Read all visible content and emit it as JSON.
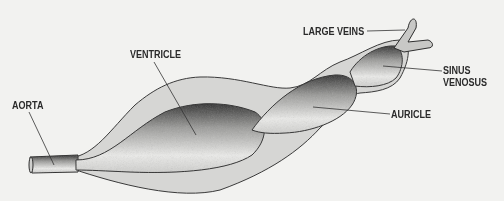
{
  "diagram": {
    "colors": {
      "background": "#f2f2f0",
      "pericardium_fill": "#d6d6d4",
      "chamber_fill": "#e6e6e4",
      "outline": "#3a3a3a",
      "label_text": "#2a2a2a"
    },
    "labels": [
      {
        "id": "large-veins",
        "text": "LARGE VEINS"
      },
      {
        "id": "ventricle",
        "text": "VENTRICLE"
      },
      {
        "id": "sinus-venosus-line1",
        "text": "SINUS"
      },
      {
        "id": "sinus-venosus-line2",
        "text": "VENOSUS"
      },
      {
        "id": "aorta",
        "text": "AORTA"
      },
      {
        "id": "auricle",
        "text": "AURICLE"
      }
    ]
  }
}
